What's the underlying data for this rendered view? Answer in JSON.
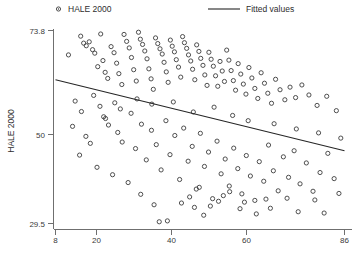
{
  "chart_data": {
    "type": "scatter",
    "title": "",
    "xlabel": "",
    "ylabel": "HALE 2000",
    "xlim": [
      8,
      86
    ],
    "ylim": [
      29.5,
      73.8
    ],
    "xticks": [
      8,
      20,
      40,
      60,
      86
    ],
    "xtick_labels": [
      "8",
      "20",
      "40",
      "60",
      "86"
    ],
    "yticks": [
      29.5,
      50,
      73.8
    ],
    "ytick_labels": [
      "29.5",
      "50",
      "73.8"
    ],
    "grid": false,
    "legend_position": "top",
    "legend": [
      {
        "label": "HALE 2000",
        "marker": "open-circle"
      },
      {
        "label": "Fitted values",
        "marker": "line"
      }
    ],
    "series": [
      {
        "name": "HALE 2000",
        "type": "scatter",
        "marker": "open-circle",
        "color": "#3c3c3c",
        "points": [
          [
            11.5,
            68.2
          ],
          [
            14.8,
            72.5
          ],
          [
            15.6,
            70.9
          ],
          [
            16.3,
            70.3
          ],
          [
            17.1,
            71.2
          ],
          [
            18.0,
            69.4
          ],
          [
            18.6,
            68.6
          ],
          [
            19.4,
            65.5
          ],
          [
            20.2,
            73.0
          ],
          [
            20.8,
            66.9
          ],
          [
            21.4,
            64.2
          ],
          [
            22.1,
            62.8
          ],
          [
            23.0,
            70.1
          ],
          [
            23.8,
            68.7
          ],
          [
            24.5,
            66.3
          ],
          [
            25.1,
            63.9
          ],
          [
            25.9,
            61.4
          ],
          [
            26.5,
            72.9
          ],
          [
            27.2,
            71.3
          ],
          [
            27.9,
            69.8
          ],
          [
            28.5,
            67.6
          ],
          [
            29.1,
            64.8
          ],
          [
            29.8,
            62.2
          ],
          [
            30.4,
            73.4
          ],
          [
            30.9,
            71.8
          ],
          [
            31.5,
            70.6
          ],
          [
            32.1,
            69.1
          ],
          [
            32.7,
            67.3
          ],
          [
            33.2,
            65.0
          ],
          [
            33.8,
            62.7
          ],
          [
            34.4,
            60.3
          ],
          [
            35.0,
            72.1
          ],
          [
            35.6,
            70.8
          ],
          [
            36.2,
            69.6
          ],
          [
            36.8,
            68.4
          ],
          [
            37.3,
            66.5
          ],
          [
            37.9,
            64.3
          ],
          [
            38.4,
            61.9
          ],
          [
            39.0,
            71.6
          ],
          [
            39.5,
            70.2
          ],
          [
            40.1,
            68.9
          ],
          [
            40.6,
            67.1
          ],
          [
            41.2,
            65.4
          ],
          [
            41.8,
            63.1
          ],
          [
            42.3,
            72.4
          ],
          [
            42.8,
            71.0
          ],
          [
            43.4,
            69.7
          ],
          [
            43.9,
            68.2
          ],
          [
            44.5,
            66.8
          ],
          [
            45.0,
            64.9
          ],
          [
            45.6,
            62.5
          ],
          [
            46.1,
            70.5
          ],
          [
            46.7,
            69.0
          ],
          [
            47.2,
            67.4
          ],
          [
            47.8,
            65.8
          ],
          [
            48.3,
            63.6
          ],
          [
            48.9,
            61.2
          ],
          [
            49.4,
            68.8
          ],
          [
            50.0,
            67.2
          ],
          [
            50.6,
            65.6
          ],
          [
            51.2,
            63.4
          ],
          [
            51.8,
            61.0
          ],
          [
            52.4,
            66.7
          ],
          [
            53.0,
            64.5
          ],
          [
            53.6,
            62.1
          ],
          [
            54.2,
            69.3
          ],
          [
            54.8,
            67.0
          ],
          [
            55.4,
            64.6
          ],
          [
            56.0,
            62.3
          ],
          [
            56.6,
            60.1
          ],
          [
            57.3,
            66.2
          ],
          [
            58.0,
            63.8
          ],
          [
            58.7,
            61.5
          ],
          [
            59.4,
            59.2
          ],
          [
            60.2,
            65.3
          ],
          [
            61.0,
            62.9
          ],
          [
            61.8,
            60.5
          ],
          [
            62.6,
            58.2
          ],
          [
            63.5,
            64.1
          ],
          [
            64.4,
            61.7
          ],
          [
            65.3,
            59.4
          ],
          [
            66.3,
            57.1
          ],
          [
            67.4,
            62.6
          ],
          [
            68.6,
            60.2
          ],
          [
            69.9,
            57.9
          ],
          [
            71.3,
            60.8
          ],
          [
            72.8,
            58.4
          ],
          [
            74.5,
            61.3
          ],
          [
            76.4,
            59.0
          ],
          [
            78.6,
            56.6
          ],
          [
            81.2,
            58.7
          ],
          [
            83.8,
            55.4
          ],
          [
            12.6,
            51.8
          ],
          [
            16.2,
            49.5
          ],
          [
            17.4,
            47.9
          ],
          [
            21.5,
            53.6
          ],
          [
            22.3,
            52.1
          ],
          [
            24.8,
            50.4
          ],
          [
            26.0,
            48.2
          ],
          [
            28.4,
            54.8
          ],
          [
            29.6,
            46.7
          ],
          [
            31.2,
            52.3
          ],
          [
            32.5,
            44.1
          ],
          [
            33.9,
            50.9
          ],
          [
            35.2,
            47.6
          ],
          [
            36.5,
            41.8
          ],
          [
            37.8,
            53.1
          ],
          [
            38.9,
            45.3
          ],
          [
            40.2,
            49.7
          ],
          [
            41.5,
            39.6
          ],
          [
            42.6,
            51.4
          ],
          [
            43.8,
            43.8
          ],
          [
            44.9,
            47.2
          ],
          [
            46.0,
            37.4
          ],
          [
            47.1,
            50.2
          ],
          [
            48.2,
            42.6
          ],
          [
            49.3,
            45.9
          ],
          [
            50.4,
            35.2
          ],
          [
            51.6,
            48.4
          ],
          [
            52.7,
            40.9
          ],
          [
            53.8,
            44.3
          ],
          [
            54.9,
            38.1
          ],
          [
            56.1,
            46.8
          ],
          [
            57.2,
            42.1
          ],
          [
            58.3,
            36.3
          ],
          [
            59.5,
            45.1
          ],
          [
            60.6,
            40.4
          ],
          [
            61.8,
            34.8
          ],
          [
            63.0,
            43.7
          ],
          [
            64.2,
            39.2
          ],
          [
            65.5,
            47.5
          ],
          [
            66.8,
            41.6
          ],
          [
            68.1,
            37.0
          ],
          [
            69.5,
            44.8
          ],
          [
            70.9,
            40.1
          ],
          [
            72.4,
            46.2
          ],
          [
            74.0,
            38.6
          ],
          [
            75.7,
            43.4
          ],
          [
            77.5,
            36.9
          ],
          [
            79.4,
            41.2
          ],
          [
            81.5,
            45.6
          ],
          [
            83.2,
            39.8
          ],
          [
            14.5,
            45.2
          ],
          [
            19.2,
            42.4
          ],
          [
            23.4,
            40.7
          ],
          [
            27.6,
            38.9
          ],
          [
            31.0,
            36.2
          ],
          [
            34.6,
            33.8
          ],
          [
            38.2,
            30.1
          ],
          [
            44.2,
            35.6
          ],
          [
            45.5,
            33.2
          ],
          [
            46.8,
            37.8
          ],
          [
            48.0,
            31.4
          ],
          [
            52.0,
            34.6
          ],
          [
            55.0,
            36.8
          ],
          [
            57.8,
            32.9
          ],
          [
            62.2,
            31.7
          ],
          [
            64.8,
            35.1
          ],
          [
            36.0,
            29.9
          ],
          [
            42.0,
            34.2
          ],
          [
            49.8,
            33.5
          ],
          [
            53.3,
            35.9
          ],
          [
            59.0,
            34.4
          ],
          [
            66.0,
            33.0
          ],
          [
            70.5,
            35.3
          ],
          [
            73.5,
            32.2
          ],
          [
            78.0,
            34.9
          ],
          [
            80.5,
            31.9
          ],
          [
            84.5,
            36.4
          ],
          [
            13.3,
            57.6
          ],
          [
            15.0,
            55.2
          ],
          [
            18.3,
            58.9
          ],
          [
            20.0,
            56.4
          ],
          [
            21.0,
            54.0
          ],
          [
            24.0,
            57.2
          ],
          [
            25.5,
            55.8
          ],
          [
            30.0,
            58.1
          ],
          [
            34.0,
            56.9
          ],
          [
            39.8,
            57.4
          ],
          [
            45.2,
            55.1
          ],
          [
            50.8,
            56.2
          ],
          [
            55.8,
            54.3
          ],
          [
            60.0,
            53.1
          ],
          [
            67.0,
            52.4
          ],
          [
            73.0,
            51.2
          ],
          [
            79.0,
            50.3
          ],
          [
            85.0,
            49.1
          ]
        ]
      },
      {
        "name": "Fitted values",
        "type": "line",
        "color": "#262626",
        "endpoints": [
          [
            8.0,
            62.5
          ],
          [
            86.0,
            46.2
          ]
        ]
      }
    ]
  }
}
